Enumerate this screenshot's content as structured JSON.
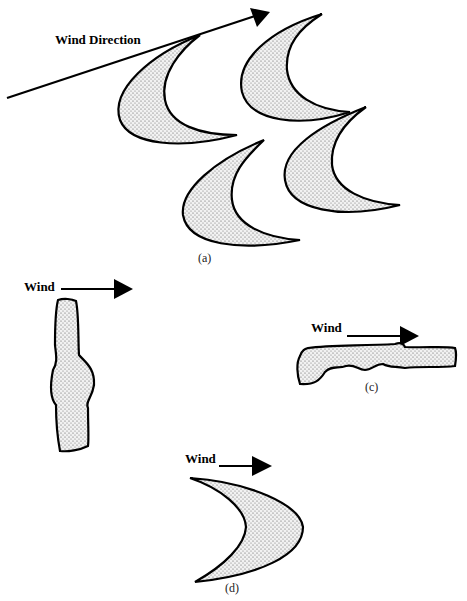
{
  "figure": {
    "panel_a": {
      "arrow_label": "Wind Direction",
      "caption": "(a)",
      "shape": "barchan-dune-field"
    },
    "panel_b": {
      "arrow_label": "Wind",
      "shape": "linear-dune-perpendicular"
    },
    "panel_c": {
      "arrow_label": "Wind",
      "caption": "(c)",
      "shape": "linear-dune-parallel"
    },
    "panel_d": {
      "arrow_label": "Wind",
      "caption": "(d)",
      "shape": "parabolic-dune"
    },
    "colors": {
      "stroke": "#000000",
      "fill": "#e8e8e8",
      "dot": "#555555",
      "background": "#ffffff"
    }
  }
}
